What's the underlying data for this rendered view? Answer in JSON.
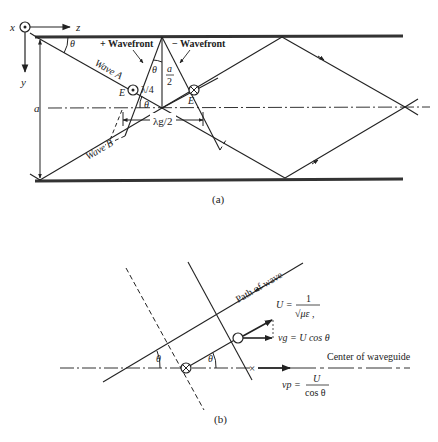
{
  "figure_a": {
    "caption": "(a)",
    "axes": {
      "x": "x",
      "z": "z",
      "y": "y"
    },
    "labels": {
      "theta_top": "θ",
      "plus_wavefront": "+ Wavefront",
      "minus_wavefront": "− Wavefront",
      "wave_a": "Wave A",
      "wave_b": "Wave B",
      "theta_mid": "θ",
      "a_over_2_num": "a",
      "a_over_2_den": "2",
      "lambda_4": "λ/4",
      "e_left": "E",
      "e_right": "E",
      "theta_bottom": "θ",
      "lambda_g_2": "λg/2",
      "a_dim": "a"
    }
  },
  "figure_b": {
    "caption": "(b)",
    "labels": {
      "path_of_wave": "Path of wave",
      "u_lhs": "U =",
      "u_num": "1",
      "u_den": "√με ,",
      "vg": "vg = U cos θ",
      "center_of_waveguide": "Center of waveguide",
      "vp_lhs": "vp =",
      "vp_num": "U",
      "vp_den": "cos θ",
      "theta_left": "θ",
      "theta_right": "θ"
    }
  }
}
